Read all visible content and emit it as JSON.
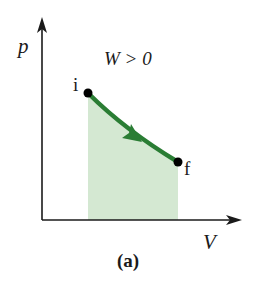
{
  "figure": {
    "caption": "(a)",
    "caption_letter": "a",
    "axes": {
      "y_label": "p",
      "x_label": "V"
    },
    "annotation": "W > 0",
    "points": {
      "initial": {
        "label": "i"
      },
      "final": {
        "label": "f"
      }
    },
    "colors": {
      "curve": "#2a7d34",
      "shaded_area": "#d4e8d2",
      "axis": "#1a1a1a",
      "point": "#000000"
    }
  }
}
